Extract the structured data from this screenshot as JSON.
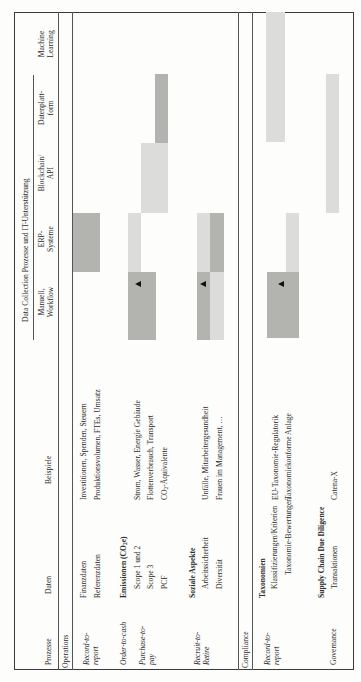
{
  "header": {
    "group_title": "Data Collection Prozesse und IT-Unterstützung",
    "col_prozesse": "Prozesse",
    "col_daten": "Daten",
    "col_beispiele": "Beispiele",
    "tech_columns": [
      {
        "l1": "Manuell,",
        "l2": "Workflow"
      },
      {
        "l1": "ERP-",
        "l2": "Systeme"
      },
      {
        "l1": "Blockchain/",
        "l2": "API"
      },
      {
        "l1": "Datenplatt-",
        "l2": "form"
      },
      {
        "l1": "Machine",
        "l2": "Learning"
      }
    ]
  },
  "sections": {
    "operations": "Operations",
    "compliance": "Compliance"
  },
  "processes": {
    "r2r_1": "Record-to-",
    "r2r_2": "report",
    "o2c": "Order-to-cash",
    "p2p_1": "Purchase-to-",
    "p2p_2": "pay",
    "rec_1": "Recruit-to-",
    "rec_2": "Retire",
    "c_r2r_1": "Record-to-",
    "c_r2r_2": "report",
    "gov": "Governance"
  },
  "daten": {
    "finanz": "Finanzdaten",
    "referenz": "Referenzdaten",
    "emissionen": "Emissionen (CO",
    "emissionen_sub": "2",
    "emissionen_end": "e)",
    "scope12": "Scope 1 und 2",
    "scope3": "Scope 3",
    "pcf": "PCF",
    "sozial": "Soziale Aspekte",
    "arbeit": "Arbeitssicherheit",
    "divers": "Diversität",
    "taxonomien": "Taxonomien",
    "klass": "Klassifizierungen/Kriterien",
    "tax_bew": "Taxonomie-Bewertungen",
    "scdd": "Supply Chain Due Diligence",
    "trans": "Transaktionen"
  },
  "beispiele": {
    "finanz": "Investitionen, Spenden, Steuern",
    "referenz": "Produktionsvolumen, FTEs, Umsatz",
    "strom": "Strom, Wasser, Energie Gebäude",
    "flotte": "Flottenverbrauch, Transport",
    "co2_pre": "CO",
    "co2_sub": "2",
    "co2_post": "-Äquivalente",
    "unfaelle": "Unfälle, Mitarbeitergesundheit",
    "frauen": "Frauen im Management, …",
    "eu_tax": "EU-Taxonomie-Regulatorik",
    "tax_anlage": "Taxonomiekonforme Anlage",
    "catena": "Catena-X"
  },
  "colors": {
    "dark_bar": "#b3b3b0",
    "light_bar": "#dcdcda",
    "marker": "#111111"
  }
}
